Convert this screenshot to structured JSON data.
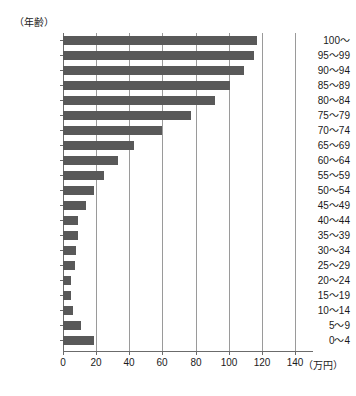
{
  "chart_data": {
    "type": "bar",
    "orientation": "horizontal",
    "title": "",
    "xlabel": "（万円）",
    "ylabel": "（年齢）",
    "xlim": [
      0,
      140
    ],
    "ylim_categories_order": "top_to_bottom",
    "grid": true,
    "legend": null,
    "bar_color": "#595959",
    "axis_color": "#6b6b6b",
    "grid_color": "#9a9a9a",
    "xticks": [
      0,
      20,
      40,
      60,
      80,
      100,
      120,
      140
    ],
    "xtick_labels": [
      "0",
      "20",
      "40",
      "60",
      "80",
      "100",
      "120",
      "140"
    ],
    "categories": [
      "100～",
      "95～99",
      "90～94",
      "85～89",
      "80～84",
      "75～79",
      "70～74",
      "65～69",
      "60～64",
      "55～59",
      "50～54",
      "45～49",
      "40～44",
      "35～39",
      "30～34",
      "25～29",
      "20～24",
      "15～19",
      "10～14",
      "5～9",
      "0～4"
    ],
    "values": [
      117,
      115,
      109,
      101,
      92,
      77,
      60,
      43,
      33,
      25,
      19,
      14,
      9,
      9,
      8,
      7,
      5,
      5,
      6,
      11,
      19
    ]
  },
  "axis": {
    "y_unit_caption": "（年齢）",
    "x_unit_caption": "（万円）"
  }
}
